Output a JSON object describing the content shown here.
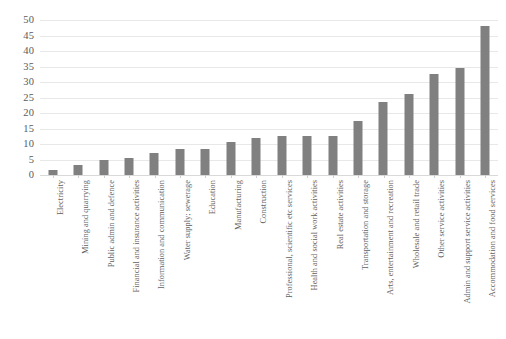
{
  "chart_data": {
    "type": "bar",
    "title": "",
    "subtitle": "",
    "xlabel": "",
    "ylabel": "",
    "ylim": [
      0,
      50
    ],
    "ytick_step": 5,
    "yticks": [
      50,
      45,
      40,
      35,
      30,
      25,
      20,
      15,
      10,
      5,
      0
    ],
    "grid": true,
    "legend": false,
    "legend_position": "none",
    "bar_color": "#808080",
    "gridline_color": "#e8e8e8",
    "label_rotation": -90,
    "categories": [
      "Electricity",
      "Mining and quarrying",
      "Public admin and defence",
      "Financial and insurance activities",
      "Information and communication",
      "Water supply; sewerage",
      "Education",
      "Manufacturing",
      "Construction",
      "Professional, scientific etc services",
      "Health and social work activities",
      "Real estate activities",
      "Transportation and storage",
      "Arts, entertainment and recreation",
      "Wholesale and retail trade",
      "Other service activities",
      "Admin and support service activities",
      "Accommodation and food services"
    ],
    "values": [
      1.5,
      3.3,
      4.8,
      5.5,
      7.0,
      8.3,
      8.3,
      10.5,
      12.0,
      12.5,
      12.7,
      12.5,
      17.5,
      23.5,
      26.0,
      32.5,
      34.5,
      48.0
    ]
  }
}
